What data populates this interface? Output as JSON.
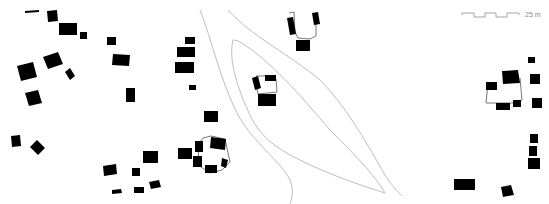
{
  "map": {
    "type": "figure-ground building footprint map",
    "background": "#ffffff",
    "building_color": "#000000",
    "road_color": "#b5b5b5",
    "scale_bar": {
      "label": "25 m",
      "segments": 4
    }
  }
}
